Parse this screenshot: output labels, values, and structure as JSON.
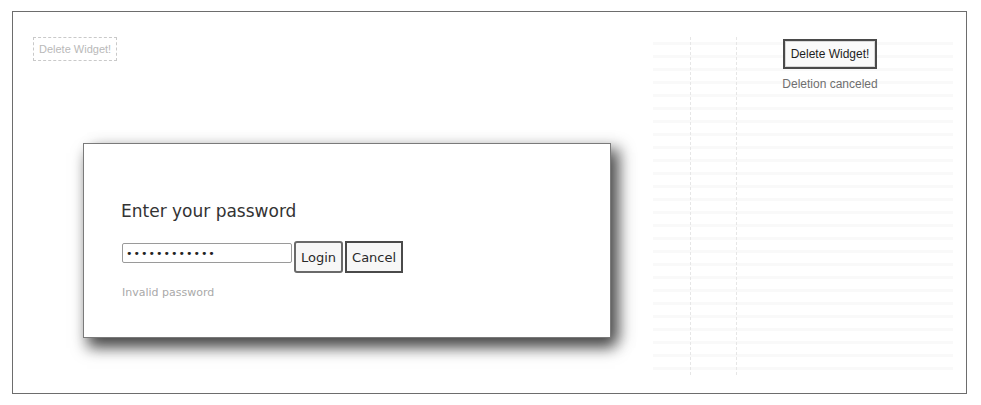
{
  "background_panel": {
    "delete_button_label": "Delete Widget!"
  },
  "right_panel": {
    "delete_button_label": "Delete Widget!",
    "status": "Deletion canceled"
  },
  "modal": {
    "title": "Enter your password",
    "password_value": "••••••••••••",
    "login_label": "Login",
    "cancel_label": "Cancel",
    "error": "Invalid password"
  }
}
